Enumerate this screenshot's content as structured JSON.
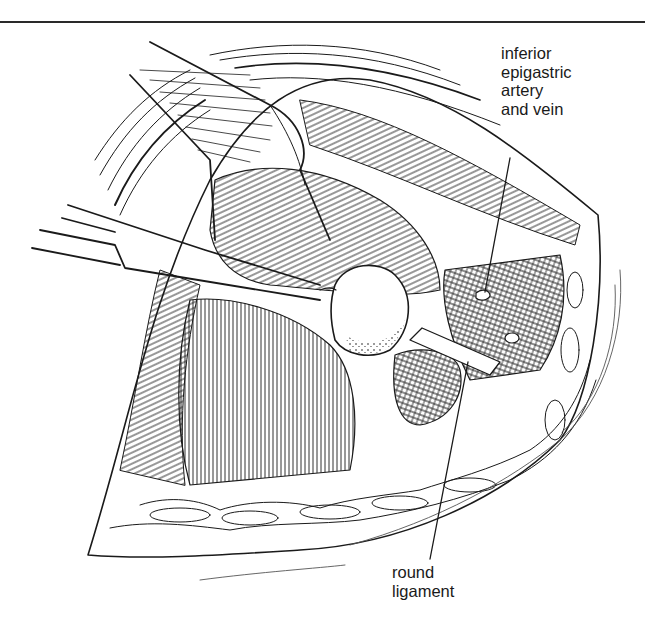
{
  "figure": {
    "type": "surgical anatomical line illustration",
    "colors": {
      "ink": "#1a1a1a",
      "background": "#ffffff",
      "rule": "#2a2a2a"
    }
  },
  "labels": [
    {
      "id": "inferior-epigastric",
      "lines": [
        "inferior",
        "epigastric",
        "artery",
        "and vein"
      ]
    },
    {
      "id": "round-ligament",
      "lines": [
        "round",
        "ligament"
      ]
    }
  ]
}
